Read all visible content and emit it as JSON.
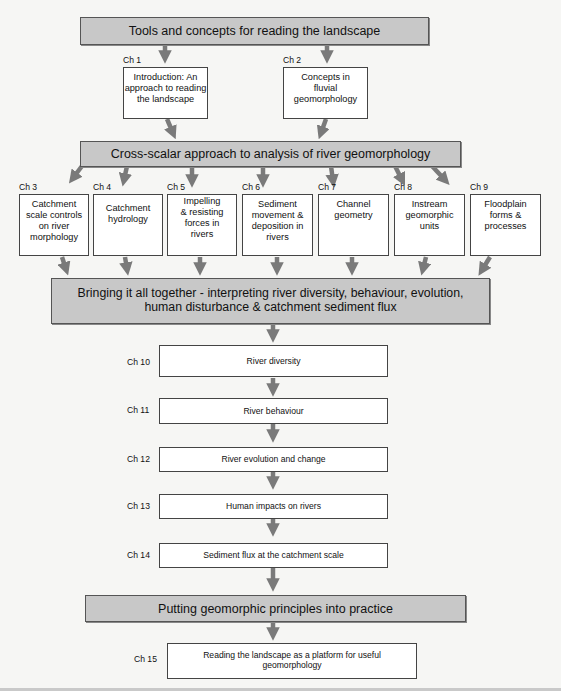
{
  "banners": {
    "tools": "Tools and concepts for reading the landscape",
    "cross_scalar": "Cross-scalar approach to analysis of river geomorphology",
    "bringing_line1": "Bringing it all together - interpreting river diversity, behaviour, evolution,",
    "bringing_line2": "human disturbance & catchment sediment flux",
    "putting": "Putting geomorphic principles into practice"
  },
  "top_chapters": [
    {
      "label": "Ch 1",
      "title": "Introduction: An approach to reading the landscape"
    },
    {
      "label": "Ch 2",
      "title": "Concepts in fluvial geomorphology"
    }
  ],
  "middle_chapters": [
    {
      "label": "Ch 3",
      "title": "Catchment scale controls on river morphology"
    },
    {
      "label": "Ch 4",
      "title": "Catchment hydrology"
    },
    {
      "label": "Ch 5",
      "title": "Impelling & resisting forces in rivers"
    },
    {
      "label": "Ch 6",
      "title": "Sediment movement & deposition in rivers"
    },
    {
      "label": "Ch 7",
      "title": "Channel geometry"
    },
    {
      "label": "Ch 8",
      "title": "Instream geomorphic units"
    },
    {
      "label": "Ch 9",
      "title": "Floodplain forms & processes"
    }
  ],
  "sequence_chapters": [
    {
      "label": "Ch 10",
      "title": "River diversity"
    },
    {
      "label": "Ch 11",
      "title": "River behaviour"
    },
    {
      "label": "Ch 12",
      "title": "River evolution and change"
    },
    {
      "label": "Ch 13",
      "title": "Human impacts on rivers"
    },
    {
      "label": "Ch 14",
      "title": "Sediment flux at the catchment scale"
    }
  ],
  "final_chapter": {
    "label": "Ch 15",
    "title": "Reading the landscape as a platform for useful geomorphology"
  },
  "colors": {
    "banner_fill": "#c8c8c8",
    "arrow": "#7a7a7a",
    "box_border": "#444444"
  }
}
